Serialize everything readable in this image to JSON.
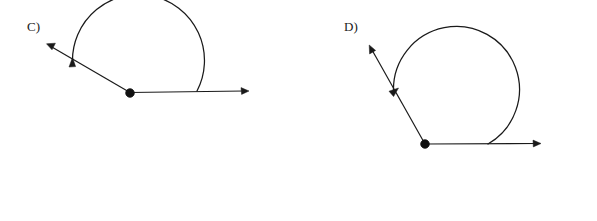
{
  "page": {
    "background_color": "#ffffff",
    "ink_color": "#1a1a1a",
    "width": 597,
    "height": 221
  },
  "figures": [
    {
      "id": "figure-c",
      "label": "C)",
      "label_position": {
        "x": 27,
        "y": 19
      },
      "vertex": {
        "x": 130,
        "y": 93,
        "radius": 4.6
      },
      "rays": [
        {
          "name": "horizontal-right-ray",
          "from": {
            "x": 130,
            "y": 93
          },
          "to": {
            "x": 248,
            "y": 91
          },
          "arrow_at": "end",
          "direction_degrees": 0
        },
        {
          "name": "upper-left-ray",
          "from": {
            "x": 130,
            "y": 93
          },
          "to": {
            "x": 47,
            "y": 44
          },
          "arrow_at": "end",
          "direction_degrees": 149
        }
      ],
      "arc": {
        "name": "angle-arc-c",
        "center": {
          "x": 131,
          "y": 93
        },
        "radius": 66,
        "start_point": {
          "x": 197,
          "y": 91
        },
        "end_point": {
          "x": 72,
          "y": 62
        },
        "sweep": "clockwise-downward-through-bottom",
        "start_angle_degrees": 0,
        "end_angle_degrees": 208,
        "arrow_at": "end",
        "arrow_direction_degrees": 118
      }
    },
    {
      "id": "figure-d",
      "label": "D)",
      "label_position": {
        "x": 344,
        "y": 19
      },
      "vertex": {
        "x": 425,
        "y": 144,
        "radius": 4.6
      },
      "rays": [
        {
          "name": "horizontal-right-ray",
          "from": {
            "x": 425,
            "y": 144
          },
          "to": {
            "x": 540,
            "y": 144
          },
          "arrow_at": "end",
          "direction_degrees": 0
        },
        {
          "name": "upper-left-ray",
          "from": {
            "x": 425,
            "y": 144
          },
          "to": {
            "x": 369,
            "y": 45
          },
          "arrow_at": "end",
          "direction_degrees": 119
        }
      ],
      "arc": {
        "name": "angle-arc-d",
        "center": {
          "x": 425,
          "y": 144
        },
        "radius": 63,
        "start_point": {
          "x": 488,
          "y": 144
        },
        "end_point": {
          "x": 396,
          "y": 90
        },
        "sweep": "clockwise-downward-through-bottom-and-left",
        "start_angle_degrees": 0,
        "end_angle_degrees": 240,
        "arrow_at": "end",
        "arrow_direction_degrees": 62
      }
    }
  ]
}
